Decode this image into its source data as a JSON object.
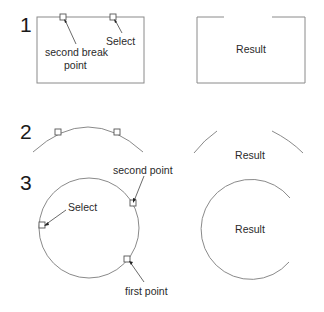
{
  "steps": [
    {
      "number": "1",
      "shape": "rectangle",
      "labels": {
        "second_break_line1": "second break",
        "second_break_line2": "point",
        "select": "Select"
      },
      "result_label": "Result"
    },
    {
      "number": "2",
      "shape": "arc",
      "result_label": "Result"
    },
    {
      "number": "3",
      "shape": "circle",
      "labels": {
        "select": "Select",
        "second_point": "second point",
        "first_point": "first point"
      },
      "result_label": "Result"
    }
  ],
  "colors": {
    "shape_stroke": "#8a8a8a",
    "text": "#2a2a2a",
    "background": "#ffffff"
  }
}
